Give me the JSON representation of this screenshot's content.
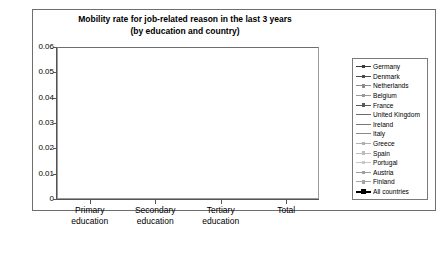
{
  "chart_data": {
    "type": "line",
    "title": "Mobility rate for job-related reason in the last 3 years (by education and country)",
    "title_line1": "Mobility rate for job-related reason in the last 3 years",
    "title_line2": "(by education and country)",
    "xlabel": "",
    "ylabel": "",
    "categories": [
      "Primary education",
      "Secondary education",
      "Tertiary education",
      "Total"
    ],
    "category_lines": [
      [
        "Primary",
        "education"
      ],
      [
        "Secondary",
        "education"
      ],
      [
        "Tertiary",
        "education"
      ],
      [
        "Total",
        ""
      ]
    ],
    "ylim": [
      0,
      0.06
    ],
    "ytick_labels": [
      "0.06",
      "0.05",
      "0.04",
      "0.03",
      "0.02",
      "0.01",
      "0"
    ],
    "ytick_values": [
      0.06,
      0.05,
      0.04,
      0.03,
      0.02,
      0.01,
      0
    ],
    "grid": true,
    "legend_position": "right",
    "series": [
      {
        "name": "Germany",
        "values": [
          0.011,
          0.0185,
          0.051,
          0.025
        ],
        "color": "#3a3a3a",
        "width": 0.9,
        "marker": "square",
        "emphasis": false
      },
      {
        "name": "Denmark",
        "values": [
          0.0105,
          0.0135,
          0.038,
          0.0215
        ],
        "color": "#4a4a4a",
        "width": 0.9,
        "marker": "square",
        "emphasis": false
      },
      {
        "name": "Netherlands",
        "values": [
          0.01,
          0.012,
          0.034,
          0.02
        ],
        "color": "#8c8c8c",
        "width": 0.8,
        "marker": "square",
        "emphasis": false
      },
      {
        "name": "Belgium",
        "values": [
          0.006,
          0.0098,
          0.0265,
          0.015
        ],
        "color": "#9a9a9a",
        "width": 0.8,
        "marker": "square",
        "emphasis": false
      },
      {
        "name": "France",
        "values": [
          0.0052,
          0.0082,
          0.0235,
          0.0132
        ],
        "color": "#5a5a5a",
        "width": 0.9,
        "marker": "square",
        "emphasis": false
      },
      {
        "name": "United Kingdom",
        "values": [
          0.0058,
          0.009,
          0.0195,
          0.0118
        ],
        "color": "#6b6b6b",
        "width": 0.8,
        "marker": "none",
        "emphasis": false
      },
      {
        "name": "Ireland",
        "values": [
          0.0048,
          0.0072,
          0.015,
          0.0098
        ],
        "color": "#777777",
        "width": 0.8,
        "marker": "none",
        "emphasis": false
      },
      {
        "name": "Italy",
        "values": [
          0.0042,
          0.0065,
          0.0135,
          0.009
        ],
        "color": "#8a8a8a",
        "width": 0.8,
        "marker": "none",
        "emphasis": false
      },
      {
        "name": "Greece",
        "values": [
          0.0035,
          0.0052,
          0.0105,
          0.0072
        ],
        "color": "#b0b0b0",
        "width": 0.8,
        "marker": "square",
        "emphasis": false
      },
      {
        "name": "Spain",
        "values": [
          0.003,
          0.0046,
          0.0092,
          0.0062
        ],
        "color": "#bcbcbc",
        "width": 0.8,
        "marker": "square",
        "emphasis": false
      },
      {
        "name": "Portugal",
        "values": [
          0.0024,
          0.0038,
          0.0078,
          0.0052
        ],
        "color": "#c8c8c8",
        "width": 0.8,
        "marker": "square",
        "emphasis": false
      },
      {
        "name": "Austria",
        "values": [
          0.0028,
          0.0056,
          0.0112,
          0.0058
        ],
        "color": "#9f9f9f",
        "width": 0.8,
        "marker": "square",
        "emphasis": false
      },
      {
        "name": "Finland",
        "values": [
          0.0022,
          0.0034,
          0.007,
          0.0042
        ],
        "color": "#a5a5a5",
        "width": 0.8,
        "marker": "square",
        "emphasis": false
      },
      {
        "name": "All countries",
        "values": [
          0.0042,
          0.0085,
          0.0222,
          0.0105
        ],
        "color": "#000000",
        "width": 1.8,
        "marker": "square",
        "emphasis": true
      }
    ]
  }
}
